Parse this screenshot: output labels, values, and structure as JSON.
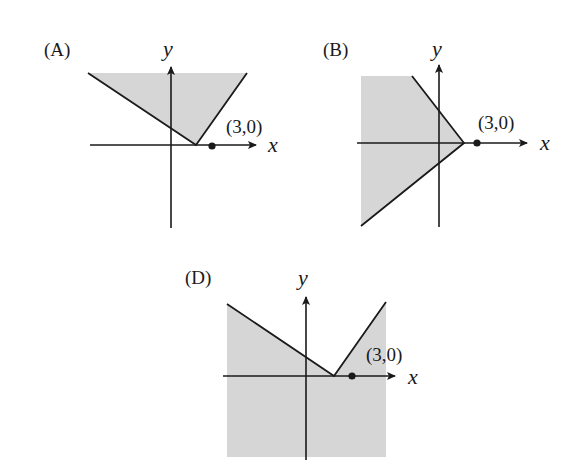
{
  "colors": {
    "shade": "#d6d6d6",
    "ink": "#1a1a1a",
    "background": "#ffffff"
  },
  "panels": [
    {
      "id": "A",
      "label": "(A)",
      "x_label": "x",
      "y_label": "y",
      "point_label": "(3,0)",
      "description": "Shaded region above a V-shaped boundary with vertex on positive x-axis left of (3,0)"
    },
    {
      "id": "B",
      "label": "(B)",
      "x_label": "x",
      "y_label": "y",
      "point_label": "(3,0)",
      "description": "Shaded region to the left of a sideways V (<) boundary with vertex on x-axis left of (3,0)"
    },
    {
      "id": "D",
      "label": "(D)",
      "x_label": "x",
      "y_label": "y",
      "point_label": "(3,0)",
      "description": "Shaded region below a V-shaped boundary with vertex on positive x-axis left of (3,0)"
    }
  ]
}
